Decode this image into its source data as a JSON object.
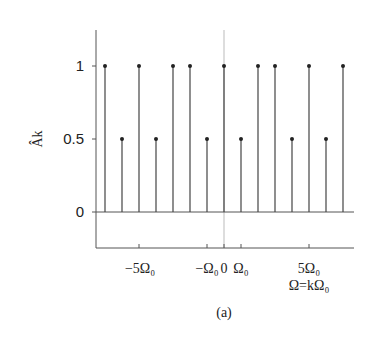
{
  "chart_data": {
    "type": "stem",
    "title": "",
    "caption": "(a)",
    "xlabel": "Ω=kΩ₀",
    "ylabel": "Âk",
    "x": [
      -7,
      -6,
      -5,
      -4,
      -3,
      -2,
      -1,
      0,
      1,
      2,
      3,
      4,
      5,
      6,
      7
    ],
    "values": [
      1,
      0.5,
      1,
      0.5,
      1,
      1,
      0.5,
      1,
      0.5,
      1,
      1,
      0.5,
      1,
      0.5,
      1
    ],
    "ylim": [
      -0.25,
      1.3
    ],
    "xlim": [
      -7.6,
      7.6
    ],
    "yticks": [
      0,
      0.5,
      1
    ],
    "ytick_labels": [
      "0",
      "0.5",
      "1"
    ],
    "xticks": [
      -5,
      -1,
      0,
      1,
      5
    ],
    "xtick_labels": [
      "−5Ω₀",
      "−Ω₀",
      "0",
      "Ω₀",
      "5Ω₀"
    ],
    "grid": false
  },
  "labels": {
    "y_axis": "Âk",
    "x_axis": "Ω=kΩ₀",
    "caption": "(a)",
    "ytick_0": "0",
    "ytick_05": "0.5",
    "ytick_1": "1",
    "xtick_m5": "−5Ω₀",
    "xtick_m1": "−Ω₀",
    "xtick_0": "0",
    "xtick_1": "Ω₀",
    "xtick_5": "5Ω₀"
  },
  "colors": {
    "stem": "#444444",
    "axis": "#555555",
    "center": "#bbbbbb"
  }
}
